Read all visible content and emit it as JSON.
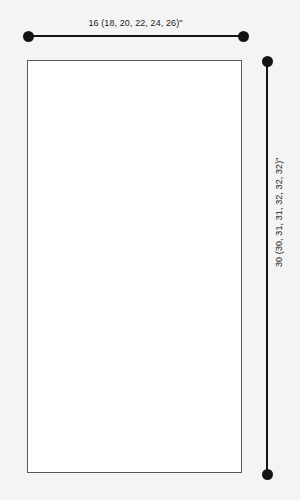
{
  "diagram": {
    "type": "garment-schematic",
    "background_color": "#f4f4f4",
    "line_color": "#141414",
    "panel": {
      "fill_color": "#ffffff",
      "border_color": "#595959"
    },
    "dimensions": {
      "width": {
        "label": "16 (18, 20, 22, 24, 26)\"",
        "base_value": 16,
        "alternate_values": [
          18,
          20,
          22,
          24,
          26
        ],
        "unit": "\"",
        "orientation": "horizontal",
        "position": "top"
      },
      "length": {
        "label": "30 (30, 31, 31, 32, 32, 32)\"",
        "base_value": 30,
        "alternate_values": [
          30,
          31,
          31,
          32,
          32,
          32
        ],
        "unit": "\"",
        "orientation": "vertical",
        "position": "right"
      }
    }
  }
}
